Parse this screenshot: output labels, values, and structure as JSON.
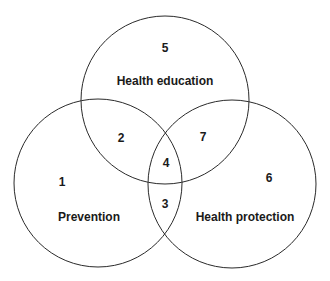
{
  "diagram": {
    "type": "venn",
    "stroke_color": "#2a2a2a",
    "sets": [
      {
        "id": "health-education",
        "label": "Health education",
        "region_number": "5"
      },
      {
        "id": "prevention",
        "label": "Prevention",
        "region_number": "1"
      },
      {
        "id": "health-protection",
        "label": "Health protection",
        "region_number": "6"
      }
    ],
    "overlaps": [
      {
        "sets": [
          "prevention",
          "health-education"
        ],
        "region_number": "2"
      },
      {
        "sets": [
          "health-education",
          "health-protection"
        ],
        "region_number": "7"
      },
      {
        "sets": [
          "prevention",
          "health-protection"
        ],
        "region_number": "3"
      },
      {
        "sets": [
          "prevention",
          "health-education",
          "health-protection"
        ],
        "region_number": "4"
      }
    ]
  }
}
